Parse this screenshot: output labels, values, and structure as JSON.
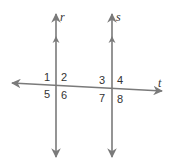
{
  "diagram": {
    "line_color": "#7a7a7a",
    "text_color": "#333333",
    "lines": {
      "r": {
        "label": "r"
      },
      "s": {
        "label": "s"
      },
      "t": {
        "label": "t"
      }
    },
    "angles": [
      {
        "id": "1",
        "label": "1"
      },
      {
        "id": "2",
        "label": "2"
      },
      {
        "id": "3",
        "label": "3"
      },
      {
        "id": "4",
        "label": "4"
      },
      {
        "id": "5",
        "label": "5"
      },
      {
        "id": "6",
        "label": "6"
      },
      {
        "id": "7",
        "label": "7"
      },
      {
        "id": "8",
        "label": "8"
      }
    ],
    "parallel_markers": 1
  }
}
